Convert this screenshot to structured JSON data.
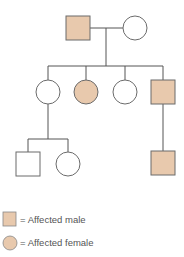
{
  "colors": {
    "affected_fill": "#e8c9ad",
    "unaffected_fill": "#ffffff",
    "stroke": "#6b6b6b",
    "line": "#555555",
    "text": "#555555"
  },
  "pedigree": {
    "generations": [
      {
        "id": "I",
        "individuals": [
          {
            "id": "I-1",
            "sex": "male",
            "affected": true
          },
          {
            "id": "I-2",
            "sex": "female",
            "affected": false
          }
        ]
      },
      {
        "id": "II",
        "individuals": [
          {
            "id": "II-1",
            "sex": "female",
            "affected": false
          },
          {
            "id": "II-2",
            "sex": "female",
            "affected": true
          },
          {
            "id": "II-3",
            "sex": "female",
            "affected": false
          },
          {
            "id": "II-4",
            "sex": "male",
            "affected": true
          }
        ]
      },
      {
        "id": "III",
        "individuals": [
          {
            "id": "III-1",
            "sex": "male",
            "affected": false,
            "parent": "II-1"
          },
          {
            "id": "III-2",
            "sex": "female",
            "affected": false,
            "parent": "II-1"
          },
          {
            "id": "III-3",
            "sex": "male",
            "affected": true,
            "parent": "II-4"
          }
        ]
      }
    ]
  },
  "legend": {
    "male_label": "= Affected male",
    "female_label": "= Affected female"
  }
}
